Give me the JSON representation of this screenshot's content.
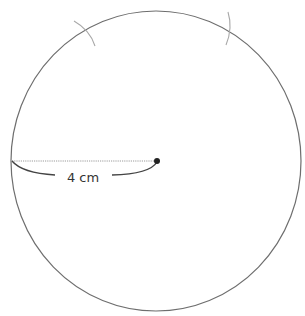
{
  "diagram": {
    "title": "",
    "radius_label": "4 cm",
    "circle": {
      "cx": 156,
      "cy": 161,
      "rx": 145,
      "ry": 150,
      "stroke": "#6e6e6e"
    },
    "center_point": {
      "x": 157,
      "y": 161,
      "color": "#222222"
    },
    "radius_line": {
      "x1": 12,
      "y1": 161,
      "x2": 157,
      "y2": 161,
      "style": "dotted",
      "color": "#9a9a9a"
    },
    "construction_arcs": [
      {
        "id": "left",
        "approx_x": 85,
        "approx_y": 30,
        "color": "#a0a0a0"
      },
      {
        "id": "right",
        "approx_x": 229,
        "approx_y": 28,
        "color": "#a0a0a0"
      }
    ],
    "colors": {
      "background": "#ffffff",
      "text": "#333333",
      "bracket": "#444444"
    }
  }
}
